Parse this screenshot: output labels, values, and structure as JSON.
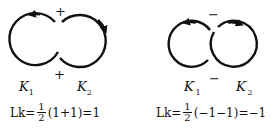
{
  "left": {
    "knot1_label": "K",
    "knot1_sub": "1",
    "knot2_label": "K",
    "knot2_sub": "2",
    "crossing_top_sign": "+",
    "crossing_bottom_sign": "+",
    "formula": {
      "lhs": "Lk=",
      "numerator": "1",
      "denominator": "2",
      "rhs": "(1+1)=1"
    }
  },
  "right": {
    "knot1_label": "K",
    "knot1_sub": "1",
    "knot1_prime": "′",
    "knot2_label": "K",
    "knot2_sub": "2",
    "knot2_prime": "′",
    "crossing_top_sign": "−",
    "crossing_bottom_sign": "−",
    "formula": {
      "lhs": "Lk=",
      "numerator": "1",
      "denominator": "2",
      "rhs": "(−1−1)=−1"
    }
  },
  "colors": {
    "stroke": "#111111",
    "background": "#ffffff"
  }
}
